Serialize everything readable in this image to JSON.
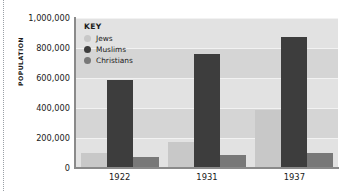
{
  "chart_data": {
    "type": "bar",
    "title": "",
    "xlabel": "",
    "ylabel": "POPULATION",
    "categories": [
      "1922",
      "1931",
      "1937"
    ],
    "ylim": [
      0,
      1000000
    ],
    "ytick_labels": [
      "1,000,000",
      "800,000",
      "600,000",
      "400,000",
      "200,000",
      "0"
    ],
    "ytick_values": [
      1000000,
      800000,
      600000,
      400000,
      200000,
      0
    ],
    "grid": true,
    "legend_position": "top-left-inside",
    "legend_title": "KEY",
    "series": [
      {
        "name": "Jews",
        "color": "#c8c8c8",
        "values": [
          100000,
          175000,
          390000
        ]
      },
      {
        "name": "Muslims",
        "color": "#3d3d3d",
        "values": [
          590000,
          760000,
          875000
        ]
      },
      {
        "name": "Christians",
        "color": "#787878",
        "values": [
          75000,
          90000,
          100000
        ]
      }
    ]
  },
  "axis": {
    "y_title": "POPULATION"
  },
  "legend": {
    "title": "KEY",
    "entries": [
      {
        "label": "Jews"
      },
      {
        "label": "Muslims"
      },
      {
        "label": "Christians"
      }
    ]
  }
}
